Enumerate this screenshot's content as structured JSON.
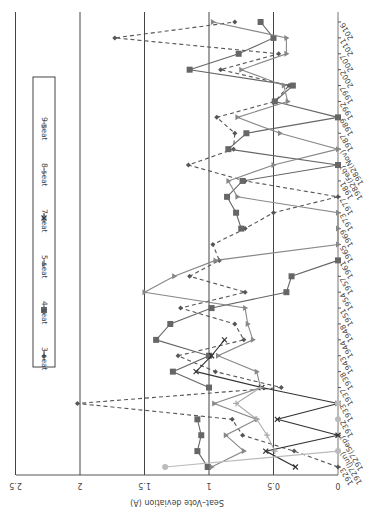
{
  "chart_data": {
    "type": "line",
    "orientation_note": "rendered rotated 180 degrees",
    "title": "",
    "xlabel": "",
    "ylabel": "Seat–Vote deviation (A)",
    "ylim": [
      0,
      2.5
    ],
    "yticks": [
      "0",
      "0.5",
      "1",
      "1.5",
      "2",
      "2.5"
    ],
    "grid": true,
    "legend_position": "top",
    "categories": [
      "1923",
      "1927(Jun)",
      "1927(Sep)",
      "1932",
      "1933",
      "1937",
      "1938",
      "1943",
      "1944",
      "1948",
      "1951",
      "1954",
      "1957",
      "1961",
      "1965",
      "1969",
      "1973",
      "1977",
      "1981",
      "1982(Feb)",
      "1982(Nov)",
      "1987",
      "1989",
      "1992",
      "1997",
      "2002",
      "2007",
      "2011",
      "2016"
    ],
    "series": [
      {
        "name": "3-seat",
        "marker": "diamond",
        "dash": "4,3",
        "color": "#555555",
        "values": [
          0,
          0.34,
          0.74,
          0.82,
          2.02,
          0.44,
          0.95,
          1.24,
          0.73,
          0.8,
          1.22,
          0.72,
          1.15,
          0.92,
          0.97,
          0.72,
          0.5,
          0,
          0.72,
          1.16,
          0.81,
          0.8,
          0.94,
          0.49,
          0.38,
          0.91,
          0.46,
          1.73,
          0.8
        ]
      },
      {
        "name": "4-seat",
        "marker": "square",
        "dash": "",
        "color": "#666666",
        "values": [
          1.01,
          1.09,
          1.06,
          1.09,
          null,
          1.0,
          1.28,
          1.0,
          1.41,
          1.3,
          0.98,
          0.4,
          0.36,
          0,
          null,
          0.75,
          0.79,
          0.86,
          0.74,
          0,
          0.85,
          0.71,
          0,
          0.49,
          0.35,
          1.15,
          0.77,
          0.5,
          0.6
        ]
      },
      {
        "name": "5-seat",
        "marker": "triangle",
        "dash": "",
        "color": "#888888",
        "values": [
          0.98,
          0.73,
          0.87,
          0.63,
          0.96,
          0.6,
          0.63,
          0.93,
          0.66,
          0.7,
          0.72,
          1.5,
          1.27,
          0.95,
          0,
          0,
          0,
          0.78,
          0.85,
          0.5,
          0,
          0.45,
          0.78,
          0.39,
          0.42,
          0.75,
          0.4,
          0.4,
          0.97
        ]
      },
      {
        "name": "7-seat",
        "marker": "x",
        "dash": "",
        "color": "#333333",
        "values": [
          0.33,
          0.56,
          0,
          0.47,
          0,
          0.59,
          1.1,
          0.98,
          0.88,
          null,
          null,
          null,
          null,
          null,
          null,
          null,
          null,
          null,
          null,
          null,
          null,
          null,
          null,
          null,
          null,
          null,
          null,
          null,
          null
        ]
      },
      {
        "name": "8-seat",
        "marker": "star",
        "dash": "",
        "color": "#aaaaaa",
        "values": [
          null,
          0.49,
          0.55,
          0.63,
          0.79,
          0.6,
          null,
          null,
          null,
          null,
          null,
          null,
          null,
          null,
          null,
          null,
          null,
          null,
          null,
          null,
          null,
          null,
          null,
          null,
          null,
          null,
          null,
          null,
          null
        ]
      },
      {
        "name": "9-seat",
        "marker": "circle",
        "dash": "",
        "color": "#bbbbbb",
        "values": [
          1.34,
          0,
          null,
          0,
          0,
          null,
          null,
          null,
          null,
          null,
          null,
          null,
          null,
          null,
          null,
          null,
          null,
          null,
          null,
          null,
          null,
          null,
          null,
          null,
          null,
          null,
          null,
          null,
          null
        ]
      }
    ]
  }
}
